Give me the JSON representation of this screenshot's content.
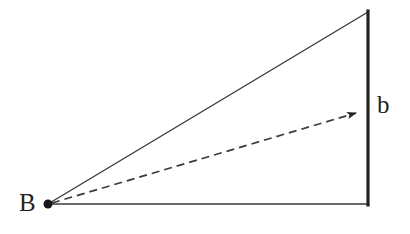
{
  "figure": {
    "type": "geometry-diagram",
    "background_color": "#ffffff",
    "stroke_color": "#3a3a3a",
    "thick_stroke_color": "#242424",
    "label_color": "#242424",
    "labels": {
      "vertex_left": "B",
      "vector_right": "b"
    },
    "geometry": {
      "vertex_B": [
        48,
        204
      ],
      "apex_top_right": [
        368,
        12
      ],
      "corner_bottom_right": [
        368,
        204
      ],
      "vector_tip": [
        362,
        110
      ],
      "vertex_dot_radius": 4.5,
      "thin_stroke_width": 1.4,
      "thick_stroke_width": 3.2,
      "dash_pattern": "8 5"
    }
  }
}
